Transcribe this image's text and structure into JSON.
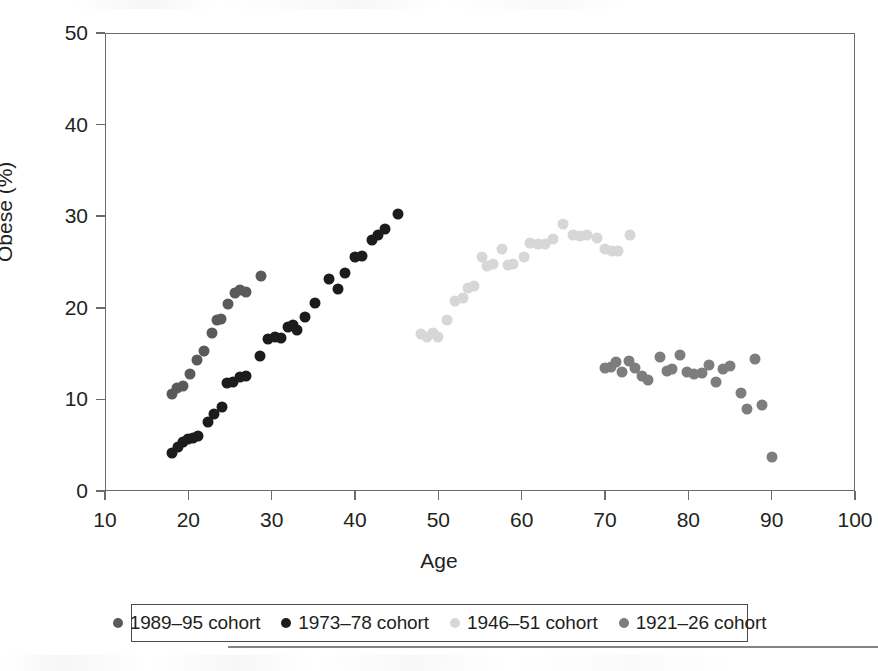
{
  "chart_data": {
    "type": "scatter",
    "title": "",
    "xlabel": "Age",
    "ylabel": "Obese (%)",
    "xlim": [
      10,
      100
    ],
    "ylim": [
      0,
      50
    ],
    "xticks": [
      10,
      20,
      30,
      40,
      50,
      60,
      70,
      80,
      90,
      100
    ],
    "yticks": [
      0,
      10,
      20,
      30,
      40,
      50
    ],
    "grid": false,
    "legend_position": "bottom",
    "series": [
      {
        "name": "1989–95 cohort",
        "color": "#5a5a5a",
        "points": [
          [
            18.0,
            10.6
          ],
          [
            18.6,
            11.2
          ],
          [
            19.4,
            11.5
          ],
          [
            20.2,
            12.8
          ],
          [
            21.0,
            14.3
          ],
          [
            21.9,
            15.3
          ],
          [
            22.8,
            17.3
          ],
          [
            23.4,
            18.7
          ],
          [
            23.9,
            18.8
          ],
          [
            24.7,
            20.4
          ],
          [
            25.6,
            21.6
          ],
          [
            26.2,
            21.9
          ],
          [
            26.9,
            21.7
          ],
          [
            28.7,
            23.5
          ]
        ]
      },
      {
        "name": "1973–78 cohort",
        "color": "#1c1c1c",
        "points": [
          [
            18.0,
            4.2
          ],
          [
            18.7,
            4.8
          ],
          [
            19.4,
            5.4
          ],
          [
            20.0,
            5.7
          ],
          [
            20.6,
            5.8
          ],
          [
            21.2,
            6.0
          ],
          [
            22.3,
            7.5
          ],
          [
            23.1,
            8.4
          ],
          [
            24.0,
            9.2
          ],
          [
            24.6,
            11.8
          ],
          [
            25.3,
            11.9
          ],
          [
            26.2,
            12.4
          ],
          [
            26.9,
            12.6
          ],
          [
            28.6,
            14.7
          ],
          [
            29.6,
            16.6
          ],
          [
            30.4,
            16.8
          ],
          [
            31.1,
            16.7
          ],
          [
            32.0,
            17.9
          ],
          [
            32.5,
            18.1
          ],
          [
            33.0,
            17.6
          ],
          [
            34.0,
            19.0
          ],
          [
            35.2,
            20.5
          ],
          [
            36.9,
            23.1
          ],
          [
            38.0,
            22.1
          ],
          [
            38.8,
            23.8
          ],
          [
            40.0,
            25.5
          ],
          [
            40.8,
            25.7
          ],
          [
            42.0,
            27.4
          ],
          [
            42.8,
            27.9
          ],
          [
            43.6,
            28.6
          ],
          [
            45.1,
            30.2
          ]
        ]
      },
      {
        "name": "1946–51 cohort",
        "color": "#d7d7d7",
        "points": [
          [
            47.9,
            17.1
          ],
          [
            48.6,
            16.8
          ],
          [
            49.3,
            17.2
          ],
          [
            50.0,
            16.8
          ],
          [
            51.0,
            18.7
          ],
          [
            52.0,
            20.7
          ],
          [
            52.9,
            21.1
          ],
          [
            53.6,
            22.2
          ],
          [
            54.3,
            22.4
          ],
          [
            55.2,
            25.5
          ],
          [
            55.8,
            24.6
          ],
          [
            56.6,
            24.8
          ],
          [
            57.6,
            26.4
          ],
          [
            58.4,
            24.7
          ],
          [
            59.0,
            24.8
          ],
          [
            60.3,
            25.5
          ],
          [
            61.0,
            27.1
          ],
          [
            62.0,
            27.0
          ],
          [
            62.8,
            27.0
          ],
          [
            63.7,
            27.5
          ],
          [
            65.0,
            29.1
          ],
          [
            66.2,
            27.9
          ],
          [
            67.0,
            27.8
          ],
          [
            67.8,
            27.9
          ],
          [
            69.0,
            27.6
          ],
          [
            70.0,
            26.4
          ],
          [
            70.8,
            26.2
          ],
          [
            71.6,
            26.2
          ],
          [
            73.0,
            28.0
          ]
        ]
      },
      {
        "name": "1921–26 cohort",
        "color": "#7d7d7d",
        "points": [
          [
            70.0,
            13.4
          ],
          [
            70.7,
            13.5
          ],
          [
            71.3,
            14.1
          ],
          [
            72.0,
            13.0
          ],
          [
            72.9,
            14.2
          ],
          [
            73.6,
            13.4
          ],
          [
            74.4,
            12.6
          ],
          [
            75.2,
            12.1
          ],
          [
            76.6,
            14.6
          ],
          [
            77.4,
            13.1
          ],
          [
            78.0,
            13.3
          ],
          [
            79.0,
            14.9
          ],
          [
            79.8,
            13.0
          ],
          [
            80.7,
            12.8
          ],
          [
            81.6,
            12.9
          ],
          [
            82.5,
            13.8
          ],
          [
            83.3,
            11.9
          ],
          [
            84.1,
            13.3
          ],
          [
            85.0,
            13.7
          ],
          [
            86.3,
            10.7
          ],
          [
            87.0,
            8.9
          ],
          [
            88.0,
            14.4
          ],
          [
            88.8,
            9.4
          ],
          [
            90.0,
            3.7
          ]
        ]
      }
    ]
  },
  "legend": {
    "items": [
      {
        "label": "1989–95 cohort",
        "color": "#5a5a5a"
      },
      {
        "label": "1973–78 cohort",
        "color": "#1c1c1c"
      },
      {
        "label": "1946–51 cohort",
        "color": "#d7d7d7"
      },
      {
        "label": "1921–26 cohort",
        "color": "#7d7d7d"
      }
    ]
  }
}
